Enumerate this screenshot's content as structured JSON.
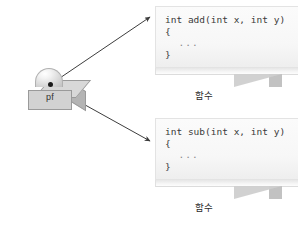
{
  "diagram": {
    "background_color": "#ffffff"
  },
  "pointer_variable": {
    "label": "pf",
    "shape_name": "cube-with-dome",
    "dot_name": "pointer-origin-dot",
    "cube_color": "#d2d2d2",
    "dome_color": "#eeeeee"
  },
  "arrows": [
    {
      "name": "arrow-to-add",
      "from": "pf",
      "to": "add-function-callout",
      "color": "#3d3d3d"
    },
    {
      "name": "arrow-to-sub",
      "from": "pf",
      "to": "sub-function-callout",
      "color": "#3d3d3d"
    }
  ],
  "callouts": [
    {
      "id": "add",
      "caption": "함수",
      "code_lines": [
        "int add(int x, int y)",
        "{",
        "  ...",
        "}"
      ]
    },
    {
      "id": "sub",
      "caption": "함수",
      "code_lines": [
        "int sub(int x, int y)",
        "{",
        "  ...",
        "}"
      ]
    }
  ]
}
